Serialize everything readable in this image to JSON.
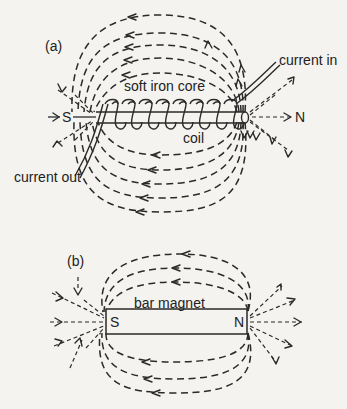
{
  "figure_a": {
    "label": "(a)",
    "core_label": "soft iron core",
    "coil_label": "coil",
    "current_in_label": "current in",
    "current_out_label": "current out",
    "south_pole": "S",
    "north_pole": "N"
  },
  "figure_b": {
    "label": "(b)",
    "magnet_label": "bar magnet",
    "south_pole": "S",
    "north_pole": "N"
  },
  "colors": {
    "background": "#f4f3ef",
    "ink": "#2a2a2a"
  }
}
